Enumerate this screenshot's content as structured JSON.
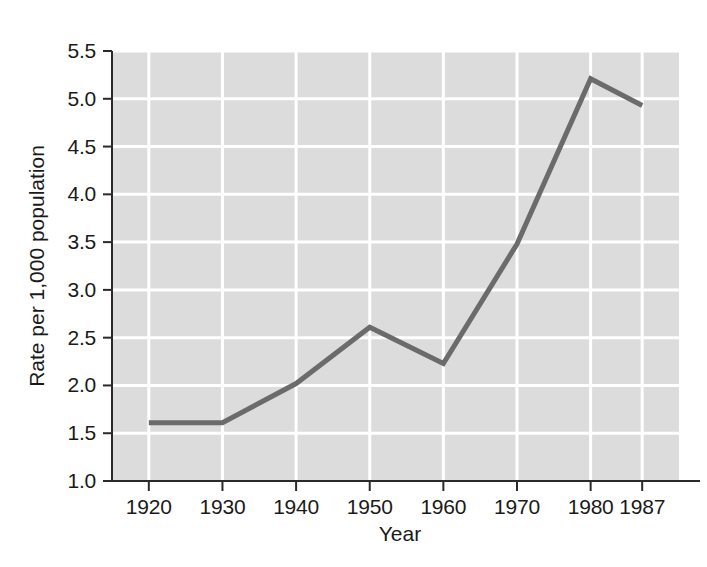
{
  "chart_data": {
    "type": "line",
    "title": "",
    "subtitle": "",
    "xlabel": "Year",
    "ylabel": "Rate per 1,000 population",
    "categories": [
      "1920",
      "1930",
      "1940",
      "1950",
      "1960",
      "1970",
      "1980",
      "1987"
    ],
    "x": [
      1920,
      1930,
      1940,
      1950,
      1960,
      1970,
      1980,
      1987
    ],
    "values": [
      1.61,
      1.61,
      2.02,
      2.61,
      2.23,
      3.48,
      5.21,
      4.93
    ],
    "series": [
      {
        "name": "Rate per 1,000 population",
        "values": [
          1.61,
          1.61,
          2.02,
          2.61,
          2.23,
          3.48,
          5.21,
          4.93
        ]
      }
    ],
    "xlim": [
      1915,
      1992
    ],
    "ylim": [
      1.0,
      5.5
    ],
    "ytick_labels": [
      "1.0",
      "1.5",
      "2.0",
      "2.5",
      "3.0",
      "3.5",
      "4.0",
      "4.5",
      "5.0",
      "5.5"
    ],
    "ytick_values": [
      1.0,
      1.5,
      2.0,
      2.5,
      3.0,
      3.5,
      4.0,
      4.5,
      5.0,
      5.5
    ],
    "xtick_labels": [
      "1920",
      "1930",
      "1940",
      "1950",
      "1960",
      "1970",
      "1980",
      "1987"
    ],
    "grid": true,
    "grid_color": "#ffffff",
    "plot_background": "#dcdcdc",
    "line_color": "#6b6b6b",
    "legend": null,
    "legend_position": "none",
    "annotations": []
  },
  "axes": {
    "y_title": "Rate per 1,000 population",
    "x_title": "Year",
    "y_ticks": [
      {
        "label": "5.5",
        "value": 5.5
      },
      {
        "label": "5.0",
        "value": 5.0
      },
      {
        "label": "4.5",
        "value": 4.5
      },
      {
        "label": "4.0",
        "value": 4.0
      },
      {
        "label": "3.5",
        "value": 3.5
      },
      {
        "label": "3.0",
        "value": 3.0
      },
      {
        "label": "2.5",
        "value": 2.5
      },
      {
        "label": "2.0",
        "value": 2.0
      },
      {
        "label": "1.5",
        "value": 1.5
      },
      {
        "label": "1.0",
        "value": 1.0
      }
    ],
    "x_ticks": [
      {
        "label": "1920",
        "value": 1920
      },
      {
        "label": "1930",
        "value": 1930
      },
      {
        "label": "1940",
        "value": 1940
      },
      {
        "label": "1950",
        "value": 1950
      },
      {
        "label": "1960",
        "value": 1960
      },
      {
        "label": "1970",
        "value": 1970
      },
      {
        "label": "1980",
        "value": 1980
      },
      {
        "label": "1987",
        "value": 1987
      }
    ]
  },
  "colors": {
    "plot_background": "#dcdcdc",
    "grid": "#ffffff",
    "line": "#6b6b6b",
    "axis": "#2a2a2a",
    "text": "#1a1a1a",
    "page_background": "#ffffff"
  }
}
